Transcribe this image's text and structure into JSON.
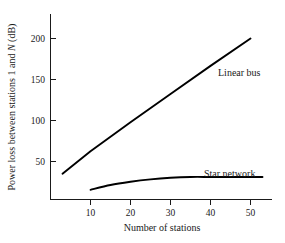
{
  "chart_data": {
    "type": "line",
    "title": "",
    "xlabel": "Number of stations",
    "ylabel_parts": {
      "pre": "Power loss between stations 1 and ",
      "italic": "N",
      "post": " (dB)"
    },
    "ylabel": "Power loss between stations 1 and N (dB)",
    "xlim": [
      0,
      55
    ],
    "ylim": [
      0,
      225
    ],
    "xticks": [
      10,
      20,
      30,
      40,
      50
    ],
    "xtick_labels": [
      "10",
      "20",
      "30",
      "40",
      "50"
    ],
    "yticks": [
      50,
      100,
      150,
      200
    ],
    "ytick_labels": [
      "50",
      "100",
      "150",
      "200"
    ],
    "grid": false,
    "legend_position": "inline-annotations",
    "series": [
      {
        "name": "Linear bus",
        "label": "Linear bus",
        "label_x": 36,
        "label_y": 152,
        "color": "#000000",
        "x": [
          3,
          10,
          20,
          30,
          40,
          50
        ],
        "values": [
          32,
          60,
          96,
          131,
          166,
          200
        ]
      },
      {
        "name": "Star network",
        "label": "Star network",
        "label_x": 34,
        "label_y": 46,
        "color": "#000000",
        "x": [
          10,
          15,
          20,
          25,
          30,
          35,
          40,
          45,
          50,
          53
        ],
        "values": [
          12,
          18,
          22,
          25,
          27,
          28,
          28,
          28,
          28,
          28
        ]
      }
    ]
  },
  "figure": {
    "background_color": "#ffffff",
    "axis_color": "#1a1a1a",
    "line_color": "#000000"
  }
}
